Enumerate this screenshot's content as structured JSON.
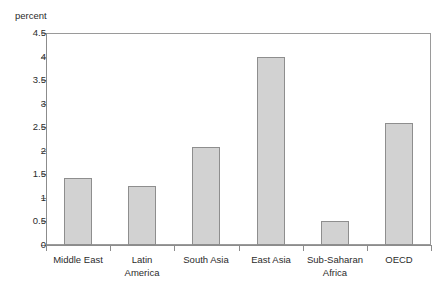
{
  "figure": {
    "title_remnant": "••••  ••••",
    "axis_caption": "percent"
  },
  "chart_data": {
    "type": "bar",
    "title": "",
    "subtitle": "",
    "xlabel": "",
    "ylabel": "percent",
    "ylim": [
      0,
      4.5
    ],
    "ytick_step": 0.5,
    "grid": false,
    "legend": "none",
    "orientation": "vertical",
    "bar_fill_color": "#d2d2d2",
    "bar_border_color": "#8e8e8e",
    "axis_color": "#8c8c8c",
    "categories": [
      "Middle East",
      "Latin\nAmerica",
      "South Asia",
      "East Asia",
      "Sub-Saharan\nAfrica",
      "OECD"
    ],
    "values": [
      1.43,
      1.26,
      2.08,
      3.99,
      0.5,
      2.58
    ],
    "ytick_labels": [
      "0",
      "0.5",
      "1",
      "1.5",
      "2",
      "2.5",
      "3",
      "3.5",
      "4",
      "4.5"
    ],
    "ytick_values": [
      0,
      0.5,
      1,
      1.5,
      2,
      2.5,
      3,
      3.5,
      4,
      4.5
    ]
  }
}
